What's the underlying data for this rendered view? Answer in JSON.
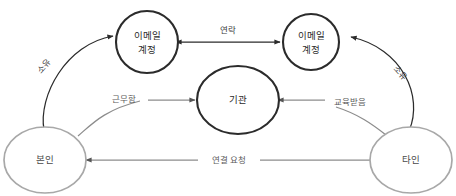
{
  "diagram": {
    "background_color": "#ffffff",
    "node_dark_stroke": "#2b2b2b",
    "node_light_stroke": "#a8a8a8",
    "edge_dark_color": "#2b2b2b",
    "edge_gray_color": "#8c8c8c",
    "nodes": [
      {
        "id": "email-left",
        "label": "이메일\n계정",
        "line1": "이메일",
        "line2": "계정",
        "shape": "circle",
        "style": "dark"
      },
      {
        "id": "email-right",
        "label": "이메일\n계정",
        "line1": "이메일",
        "line2": "계정",
        "shape": "circle",
        "style": "dark"
      },
      {
        "id": "org",
        "label": "기관",
        "line1": "기관",
        "line2": "",
        "shape": "ellipse",
        "style": "dark"
      },
      {
        "id": "self",
        "label": "본인",
        "line1": "본인",
        "line2": "",
        "shape": "circle",
        "style": "light"
      },
      {
        "id": "other",
        "label": "타인",
        "line1": "타인",
        "line2": "",
        "shape": "circle",
        "style": "light"
      }
    ],
    "edges": [
      {
        "id": "own-left",
        "label": "소유",
        "from": "self",
        "to": "email-left",
        "direction": "forward",
        "style": "dark"
      },
      {
        "id": "own-right",
        "label": "소유",
        "from": "other",
        "to": "email-right",
        "direction": "forward",
        "style": "dark"
      },
      {
        "id": "contact",
        "label": "연락",
        "from": "email-left",
        "to": "email-right",
        "direction": "bidirectional",
        "style": "dark"
      },
      {
        "id": "works-at",
        "label": "근무함",
        "from": "self",
        "to": "org",
        "direction": "forward",
        "style": "gray"
      },
      {
        "id": "educated-at",
        "label": "교육받음",
        "from": "other",
        "to": "org",
        "direction": "forward",
        "style": "gray"
      },
      {
        "id": "connect-req",
        "label": "연결 요청",
        "from": "other",
        "to": "self",
        "direction": "forward",
        "style": "gray"
      }
    ]
  }
}
